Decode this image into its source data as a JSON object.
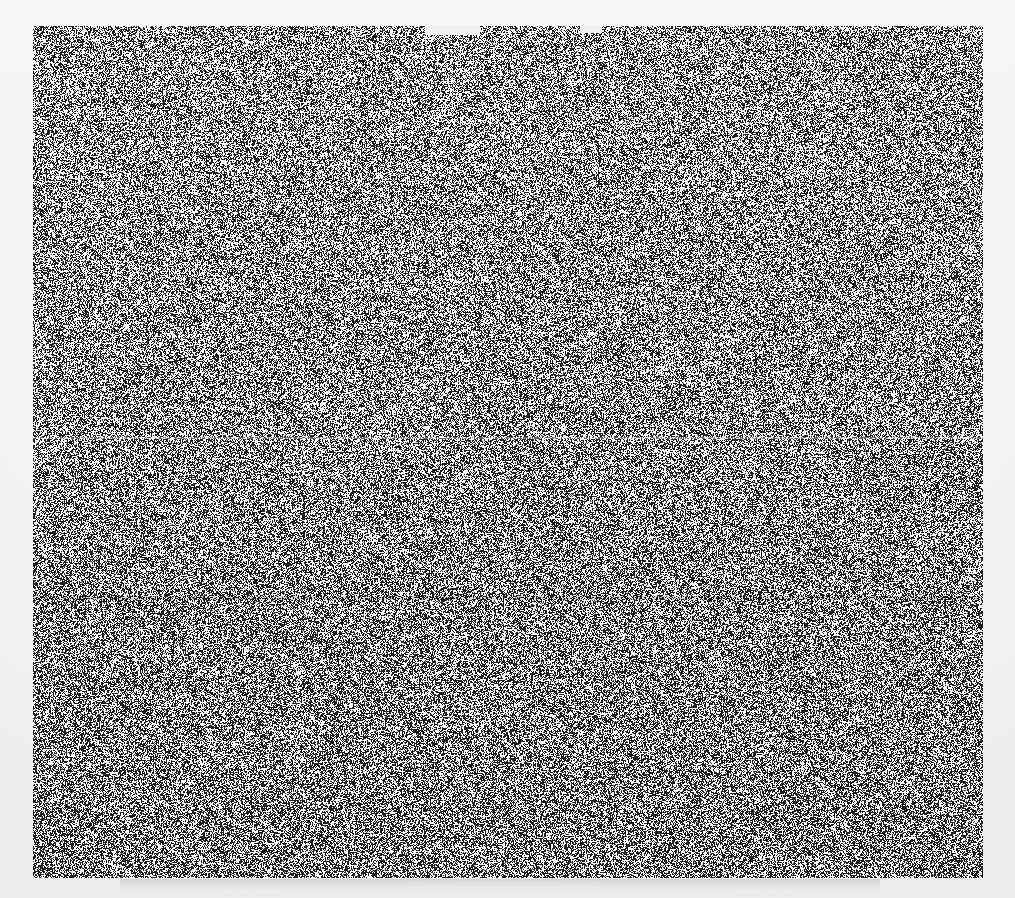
{
  "page": {
    "width": 1015,
    "height": 898,
    "background_color": "#f2f0ee"
  },
  "noise_block": {
    "label": "dithered-noise-region",
    "x": 33,
    "y": 26,
    "width": 950,
    "height": 852,
    "ink_color": "#161616",
    "paper_color": "#fbfaf8",
    "fill_ratio": 0.5,
    "pattern": "random 1-bit dither, high frequency, slight diagonal clustering",
    "density_note": "lower half reads marginally darker than upper half"
  },
  "top_notches": [
    {
      "label": "top-notch-left",
      "x": 425,
      "width": 55,
      "height": 9
    },
    {
      "label": "top-notch-right",
      "x": 580,
      "width": 22,
      "height": 7
    }
  ],
  "seams": [
    {
      "label": "seam-upper",
      "y": 437,
      "height": 2,
      "tone": "light"
    },
    {
      "label": "seam-lower",
      "y": 596,
      "height": 4,
      "tone": "dark"
    }
  ],
  "bottom_smudge": {
    "label": "scan-artifact-wash",
    "x": 120,
    "y": 879,
    "width": 760,
    "height": 14,
    "note": "faint gray residual wash below the noise block; no readable content"
  }
}
